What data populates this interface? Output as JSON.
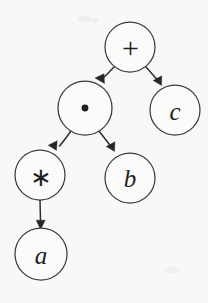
{
  "figure": {
    "kind": "expression-tree",
    "background_color": "#f8f8f6",
    "stroke_color": "#2f2f2f",
    "node_fill_color": "#fbfbf9",
    "label_color": "#1f1f1f",
    "width": 208,
    "height": 303
  },
  "nodes": [
    {
      "id": "root",
      "label": "+",
      "glyph": "plus-glyph",
      "kind": "operator",
      "cx": 130,
      "cy": 47,
      "r": 25
    },
    {
      "id": "mul",
      "label": "·",
      "glyph": "dot-glyph",
      "kind": "operator",
      "cx": 85,
      "cy": 108,
      "r": 27
    },
    {
      "id": "c",
      "label": "c",
      "glyph": "letter-c-glyph",
      "kind": "operand",
      "cx": 175,
      "cy": 110,
      "r": 25
    },
    {
      "id": "star",
      "label": "∗",
      "glyph": "asterisk-glyph",
      "kind": "operator",
      "cx": 40,
      "cy": 175,
      "r": 25
    },
    {
      "id": "b",
      "label": "b",
      "glyph": "letter-b-glyph",
      "kind": "operand",
      "cx": 130,
      "cy": 178,
      "r": 25
    },
    {
      "id": "a",
      "label": "a",
      "glyph": "letter-a-glyph",
      "kind": "operand",
      "cx": 41,
      "cy": 254,
      "r": 26
    }
  ],
  "edges": [
    {
      "id": "root-to-mul",
      "from": "root",
      "to": "mul",
      "direction": "down-left",
      "arrowhead": "filled"
    },
    {
      "id": "root-to-c",
      "from": "root",
      "to": "c",
      "direction": "down-right",
      "arrowhead": "filled"
    },
    {
      "id": "mul-to-star",
      "from": "mul",
      "to": "star",
      "direction": "down-left",
      "arrowhead": "filled"
    },
    {
      "id": "mul-to-b",
      "from": "mul",
      "to": "b",
      "direction": "down-right",
      "arrowhead": "filled"
    },
    {
      "id": "star-to-a",
      "from": "star",
      "to": "a",
      "direction": "down",
      "arrowhead": "filled"
    }
  ]
}
